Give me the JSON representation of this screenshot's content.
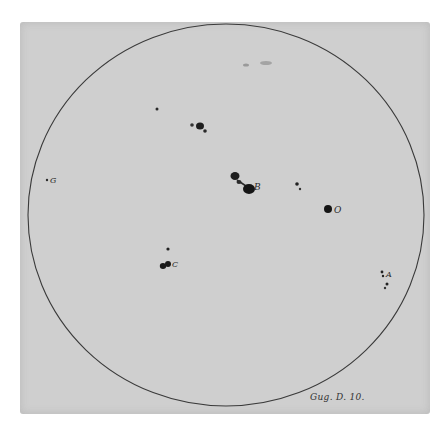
{
  "plate": {
    "background_color": "#cfcfcf",
    "ink_color": "#1e1e1e",
    "circle_color": "#3a3a3a"
  },
  "solar_disk": {
    "center": [
      226,
      215
    ],
    "radius_x": 198,
    "radius_y": 191
  },
  "spot_labels": {
    "G": "G",
    "B": "B",
    "O": "O",
    "C": "C",
    "A": "A"
  },
  "caption": "Gug. D. 10."
}
